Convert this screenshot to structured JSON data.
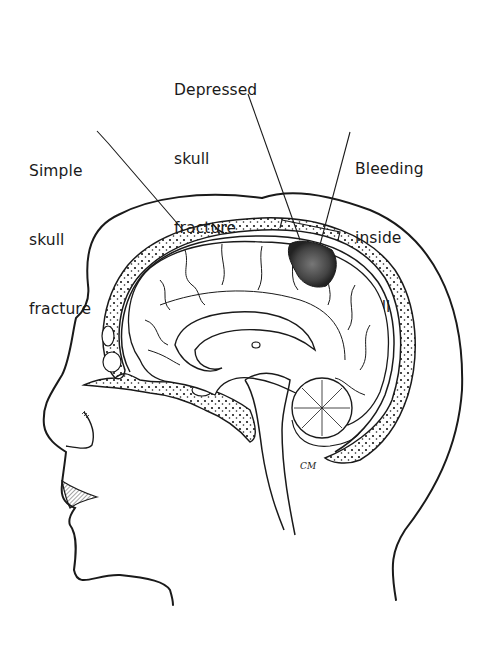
{
  "figure": {
    "labels": [
      {
        "id": "simple-skull-fracture",
        "lines": [
          "Simple",
          "skull",
          "fracture"
        ]
      },
      {
        "id": "depressed-skull-fracture",
        "lines": [
          "Depressed",
          "skull",
          "fracture"
        ]
      },
      {
        "id": "bleeding-inside-skull",
        "lines": [
          "Bleeding",
          "inside",
          "skull"
        ]
      }
    ],
    "signature": "CM",
    "colors": {
      "ink": "#1a1a1a",
      "background": "#ffffff",
      "bone_fill": "#f4f4f4",
      "hematoma": "#555555"
    }
  }
}
